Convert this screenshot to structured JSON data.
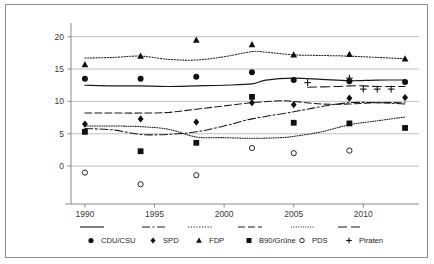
{
  "chart_data": {
    "type": "line",
    "title": "",
    "subtitle": "",
    "xlabel": "",
    "ylabel": "",
    "xlim": [
      1989,
      2014
    ],
    "ylim": [
      -4,
      21.5
    ],
    "grid": true,
    "grid_axis": "y",
    "legend_position": "bottom",
    "x_ticks": [
      1990,
      1995,
      2000,
      2005,
      2010
    ],
    "x_tick_labels": [
      "1990",
      "1995",
      "2000",
      "2005",
      "2010"
    ],
    "y_ticks": [
      0,
      5,
      10,
      15,
      20
    ],
    "y_tick_labels": [
      "0",
      "5",
      "10",
      "15",
      "20"
    ],
    "marker_years": [
      1990,
      1994,
      1998,
      2002,
      2005,
      2009,
      2013
    ],
    "series": [
      {
        "name": "CDU/CSU",
        "marker": "circle-filled",
        "line_style": "solid",
        "color": "#1a1a1a",
        "points": [
          {
            "x": 1990,
            "y": 13.5
          },
          {
            "x": 1994,
            "y": 13.5
          },
          {
            "x": 1998,
            "y": 13.8
          },
          {
            "x": 2002,
            "y": 14.5
          },
          {
            "x": 2005,
            "y": 13.3
          },
          {
            "x": 2009,
            "y": 13.1
          },
          {
            "x": 2013,
            "y": 13.0
          }
        ],
        "line": [
          {
            "x": 1990,
            "y": 12.5
          },
          {
            "x": 1992,
            "y": 12.4
          },
          {
            "x": 1994,
            "y": 12.4
          },
          {
            "x": 1996,
            "y": 12.3
          },
          {
            "x": 1998,
            "y": 12.4
          },
          {
            "x": 2000,
            "y": 12.5
          },
          {
            "x": 2002,
            "y": 12.7
          },
          {
            "x": 2003,
            "y": 13.3
          },
          {
            "x": 2005,
            "y": 13.6
          },
          {
            "x": 2007,
            "y": 13.4
          },
          {
            "x": 2009,
            "y": 13.2
          },
          {
            "x": 2011,
            "y": 13.3
          },
          {
            "x": 2013,
            "y": 13.3
          }
        ]
      },
      {
        "name": "SPD",
        "marker": "diamond-filled",
        "line_style": "dashdot",
        "color": "#1a1a1a",
        "points": [
          {
            "x": 1990,
            "y": 6.5
          },
          {
            "x": 1994,
            "y": 7.3
          },
          {
            "x": 1998,
            "y": 6.8
          },
          {
            "x": 2002,
            "y": 9.8
          },
          {
            "x": 2005,
            "y": 9.5
          },
          {
            "x": 2009,
            "y": 10.5
          },
          {
            "x": 2013,
            "y": 10.6
          }
        ],
        "line": [
          {
            "x": 1990,
            "y": 5.8
          },
          {
            "x": 1992,
            "y": 5.6
          },
          {
            "x": 1994,
            "y": 4.9
          },
          {
            "x": 1996,
            "y": 4.9
          },
          {
            "x": 1998,
            "y": 5.3
          },
          {
            "x": 2000,
            "y": 6.2
          },
          {
            "x": 2002,
            "y": 7.3
          },
          {
            "x": 2005,
            "y": 8.4
          },
          {
            "x": 2007,
            "y": 9.2
          },
          {
            "x": 2009,
            "y": 9.8
          },
          {
            "x": 2011,
            "y": 9.8
          },
          {
            "x": 2013,
            "y": 9.6
          }
        ]
      },
      {
        "name": "FDP",
        "marker": "triangle-filled",
        "line_style": "dotted",
        "color": "#1a1a1a",
        "points": [
          {
            "x": 1990,
            "y": 15.7
          },
          {
            "x": 1994,
            "y": 17.0
          },
          {
            "x": 1998,
            "y": 19.5
          },
          {
            "x": 2002,
            "y": 18.8
          },
          {
            "x": 2005,
            "y": 17.2
          },
          {
            "x": 2009,
            "y": 17.3
          },
          {
            "x": 2013,
            "y": 16.6
          }
        ],
        "line": [
          {
            "x": 1990,
            "y": 16.7
          },
          {
            "x": 1992,
            "y": 16.8
          },
          {
            "x": 1994,
            "y": 17.0
          },
          {
            "x": 1996,
            "y": 16.5
          },
          {
            "x": 1998,
            "y": 16.4
          },
          {
            "x": 2000,
            "y": 16.9
          },
          {
            "x": 2002,
            "y": 17.7
          },
          {
            "x": 2003,
            "y": 17.6
          },
          {
            "x": 2005,
            "y": 17.2
          },
          {
            "x": 2007,
            "y": 17.1
          },
          {
            "x": 2009,
            "y": 17.0
          },
          {
            "x": 2011,
            "y": 16.8
          },
          {
            "x": 2013,
            "y": 16.6
          }
        ]
      },
      {
        "name": "B90/Grüne",
        "marker": "square-filled",
        "line_style": "dashed",
        "color": "#1a1a1a",
        "points": [
          {
            "x": 1990,
            "y": 5.3
          },
          {
            "x": 1994,
            "y": 2.3
          },
          {
            "x": 1998,
            "y": 3.6
          },
          {
            "x": 2002,
            "y": 10.7
          },
          {
            "x": 2005,
            "y": 6.7
          },
          {
            "x": 2009,
            "y": 6.6
          },
          {
            "x": 2013,
            "y": 5.9
          }
        ],
        "line": [
          {
            "x": 1990,
            "y": 8.2
          },
          {
            "x": 1992,
            "y": 8.2
          },
          {
            "x": 1994,
            "y": 8.2
          },
          {
            "x": 1996,
            "y": 8.3
          },
          {
            "x": 1998,
            "y": 8.8
          },
          {
            "x": 2000,
            "y": 9.3
          },
          {
            "x": 2002,
            "y": 9.8
          },
          {
            "x": 2004,
            "y": 10.1
          },
          {
            "x": 2005,
            "y": 10.0
          },
          {
            "x": 2007,
            "y": 9.6
          },
          {
            "x": 2009,
            "y": 9.6
          },
          {
            "x": 2011,
            "y": 9.8
          },
          {
            "x": 2013,
            "y": 9.8
          }
        ]
      },
      {
        "name": "PDS",
        "marker": "circle-open",
        "line_style": "finedotted",
        "color": "#1a1a1a",
        "points": [
          {
            "x": 1990,
            "y": -1.0
          },
          {
            "x": 1994,
            "y": -2.8
          },
          {
            "x": 1998,
            "y": -1.4
          },
          {
            "x": 2002,
            "y": 2.8
          },
          {
            "x": 2005,
            "y": 2.0
          },
          {
            "x": 2009,
            "y": 2.4
          }
        ],
        "line": [
          {
            "x": 1990,
            "y": 6.2
          },
          {
            "x": 1992,
            "y": 6.2
          },
          {
            "x": 1994,
            "y": 6.1
          },
          {
            "x": 1996,
            "y": 5.7
          },
          {
            "x": 1998,
            "y": 4.5
          },
          {
            "x": 2000,
            "y": 4.4
          },
          {
            "x": 2002,
            "y": 4.3
          },
          {
            "x": 2004,
            "y": 4.4
          },
          {
            "x": 2005,
            "y": 4.6
          },
          {
            "x": 2007,
            "y": 5.3
          },
          {
            "x": 2009,
            "y": 6.4
          },
          {
            "x": 2011,
            "y": 7.0
          },
          {
            "x": 2013,
            "y": 7.6
          }
        ]
      },
      {
        "name": "Piraten",
        "marker": "plus",
        "line_style": "longdash",
        "color": "#1a1a1a",
        "points": [
          {
            "x": 2006,
            "y": 12.9
          },
          {
            "x": 2009,
            "y": 13.6
          },
          {
            "x": 2010,
            "y": 11.9
          },
          {
            "x": 2011,
            "y": 11.9
          },
          {
            "x": 2012,
            "y": 11.9
          }
        ],
        "line": [
          {
            "x": 2006,
            "y": 12.2
          },
          {
            "x": 2008,
            "y": 12.3
          },
          {
            "x": 2009,
            "y": 12.4
          },
          {
            "x": 2010,
            "y": 12.4
          },
          {
            "x": 2011,
            "y": 12.3
          },
          {
            "x": 2013,
            "y": 12.3
          }
        ]
      }
    ],
    "legend": [
      {
        "label": "CDU/CSU",
        "marker": "circle-filled",
        "line_style": "solid"
      },
      {
        "label": "SPD",
        "marker": "diamond-filled",
        "line_style": "dashdot"
      },
      {
        "label": "FDP",
        "marker": "triangle-filled",
        "line_style": "dotted"
      },
      {
        "label": "B90/Grüne",
        "marker": "square-filled",
        "line_style": "dashed"
      },
      {
        "label": "PDS",
        "marker": "circle-open",
        "line_style": "finedotted"
      },
      {
        "label": "Piraten",
        "marker": "plus",
        "line_style": "longdash"
      }
    ]
  }
}
